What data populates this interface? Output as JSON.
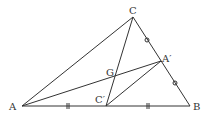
{
  "diagram": {
    "type": "triangle-medians",
    "points": {
      "A": {
        "label": "A",
        "x": 22,
        "y": 106
      },
      "B": {
        "label": "B",
        "x": 190,
        "y": 106
      },
      "C": {
        "label": "C",
        "x": 133,
        "y": 17
      },
      "A_prime": {
        "label": "A′",
        "x": 161,
        "y": 61
      },
      "C_prime": {
        "label": "C′",
        "x": 106,
        "y": 106
      },
      "G": {
        "label": "G",
        "x": 114,
        "y": 78
      }
    },
    "segments": [
      "AB",
      "BC",
      "CA",
      "AA′",
      "CC′",
      "C′A′"
    ],
    "marks": {
      "equal_ticks": "||",
      "equal_circles": "o"
    },
    "stroke_color": "#333333"
  }
}
